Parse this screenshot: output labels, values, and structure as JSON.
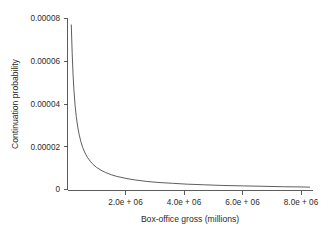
{
  "chart_data": {
    "type": "line",
    "title": "",
    "subtitle": "",
    "xlabel": "Box-office gross (millions)",
    "ylabel": "Continuation probability",
    "xlim": [
      0,
      8400000
    ],
    "ylim": [
      0,
      8e-05
    ],
    "grid": false,
    "legend": null,
    "annotations": [],
    "xticks": [
      {
        "value": 2000000,
        "label": "2.0e + 06"
      },
      {
        "value": 4000000,
        "label": "4.0e + 06"
      },
      {
        "value": 6000000,
        "label": "6.0e + 06"
      },
      {
        "value": 8000000,
        "label": "8.0e + 06"
      }
    ],
    "yticks": [
      {
        "value": 0,
        "label": "0"
      },
      {
        "value": 2e-05,
        "label": "0.00002"
      },
      {
        "value": 4e-05,
        "label": "0.00004"
      },
      {
        "value": 6e-05,
        "label": "0.00006"
      },
      {
        "value": 8e-05,
        "label": "0.00008"
      }
    ],
    "series": [
      {
        "name": "continuation probability",
        "color": "#555555",
        "x": [
          130000,
          160000,
          190000,
          220000,
          260000,
          300000,
          350000,
          400000,
          460000,
          520000,
          600000,
          680000,
          780000,
          880000,
          1000000,
          1150000,
          1300000,
          1500000,
          1700000,
          2000000,
          2300000,
          2700000,
          3100000,
          3600000,
          4100000,
          4700000,
          5300000,
          6000000,
          6700000,
          7400000,
          8000000,
          8300000
        ],
        "y": [
          7.7e-05,
          6.4e-05,
          5.4e-05,
          4.66e-05,
          3.94e-05,
          3.42e-05,
          2.93e-05,
          2.57e-05,
          2.23e-05,
          1.97e-05,
          1.71e-05,
          1.51e-05,
          1.32e-05,
          1.17e-05,
          1.03e-05,
          9e-06,
          8e-06,
          6.9e-06,
          6.1e-06,
          5.2e-06,
          4.5e-06,
          3.8e-06,
          3.3e-06,
          2.9e-06,
          2.5e-06,
          2.2e-06,
          1.9e-06,
          1.7e-06,
          1.5e-06,
          1.3e-06,
          1.2e-06,
          1.1e-06
        ]
      }
    ]
  },
  "axes": {
    "y_title": "Continuation probability",
    "x_title": "Box-office gross (millions)",
    "y_tick_labels": [
      "0.00008",
      "0.00006",
      "0.00004",
      "0.00002",
      "0"
    ],
    "x_tick_labels": [
      "2.0e + 06",
      "4.0e + 06",
      "6.0e + 06",
      "8.0e + 06"
    ]
  }
}
